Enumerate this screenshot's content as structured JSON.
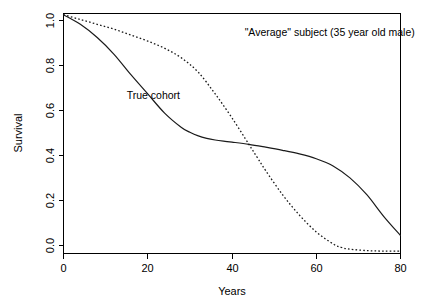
{
  "chart_data": {
    "type": "line",
    "title": "",
    "xlabel": "Years",
    "ylabel": "Survival",
    "xlim": [
      0,
      80
    ],
    "ylim": [
      0.0,
      1.0
    ],
    "grid": false,
    "legend_position": "inline-annotations",
    "xticks": [
      "0",
      "20",
      "40",
      "60",
      "80"
    ],
    "xtick_values": [
      0,
      20,
      40,
      60,
      80
    ],
    "yticks": [
      "0.0",
      "0.2",
      "0.4",
      "0.6",
      "0.8",
      "1.0"
    ],
    "ytick_values": [
      0.0,
      0.2,
      0.4,
      0.6,
      0.8,
      1.0
    ],
    "series": [
      {
        "name": "True cohort",
        "style": "solid",
        "x": [
          0,
          4,
          8,
          12,
          16,
          20,
          24,
          28,
          30,
          32,
          34,
          36,
          38,
          40,
          44,
          48,
          52,
          56,
          60,
          64,
          68,
          72,
          76,
          80
        ],
        "values": [
          0.995,
          0.955,
          0.9,
          0.83,
          0.745,
          0.665,
          0.585,
          0.525,
          0.505,
          0.49,
          0.48,
          0.473,
          0.468,
          0.464,
          0.455,
          0.443,
          0.43,
          0.415,
          0.395,
          0.365,
          0.315,
          0.245,
          0.155,
          0.075
        ]
      },
      {
        "name": "\"Average\" subject  (35 year old male)",
        "style": "dotted",
        "x": [
          0,
          4,
          8,
          12,
          16,
          20,
          24,
          28,
          32,
          36,
          40,
          44,
          46,
          48,
          52,
          56,
          60,
          64,
          66,
          68,
          72,
          76,
          80
        ],
        "values": [
          0.995,
          0.975,
          0.955,
          0.935,
          0.91,
          0.885,
          0.855,
          0.815,
          0.755,
          0.665,
          0.565,
          0.455,
          0.4,
          0.345,
          0.245,
          0.16,
          0.09,
          0.04,
          0.025,
          0.018,
          0.012,
          0.01,
          0.01
        ]
      }
    ],
    "annotations": [
      {
        "id": "average-subject-label",
        "text": "\"Average\" subject  (35 year old male)",
        "x_year": 43,
        "y_survival": 0.905
      },
      {
        "id": "true-cohort-label",
        "text": "True cohort",
        "x_year": 15,
        "y_survival": 0.645
      }
    ]
  }
}
